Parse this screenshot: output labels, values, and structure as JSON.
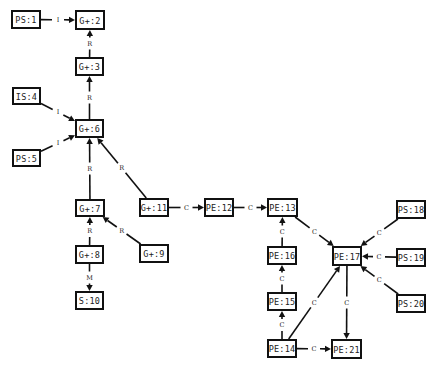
{
  "diagram": {
    "width": 433,
    "height": 369,
    "colors": {
      "stroke": "#111111",
      "text": "#222222",
      "background": "#ffffff"
    },
    "nodes": [
      {
        "id": "PS:1",
        "label": "PS:1",
        "x": 12,
        "y": 11,
        "w": 28,
        "h": 17
      },
      {
        "id": "G+:2",
        "label": "G+:2",
        "x": 76,
        "y": 11,
        "w": 28,
        "h": 18
      },
      {
        "id": "G+:3",
        "label": "G+:3",
        "x": 76,
        "y": 58,
        "w": 27,
        "h": 17
      },
      {
        "id": "IS:4",
        "label": "IS:4",
        "x": 13,
        "y": 88,
        "w": 27,
        "h": 16
      },
      {
        "id": "PS:5",
        "label": "PS:5",
        "x": 13,
        "y": 150,
        "w": 27,
        "h": 16
      },
      {
        "id": "G+:6",
        "label": "G+:6",
        "x": 76,
        "y": 120,
        "w": 27,
        "h": 17
      },
      {
        "id": "G+:7",
        "label": "G+:7",
        "x": 76,
        "y": 200,
        "w": 28,
        "h": 16
      },
      {
        "id": "G+:8",
        "label": "G+:8",
        "x": 76,
        "y": 246,
        "w": 27,
        "h": 17
      },
      {
        "id": "G+:9",
        "label": "G+:9",
        "x": 140,
        "y": 245,
        "w": 28,
        "h": 17
      },
      {
        "id": "S:10",
        "label": "S:10",
        "x": 76,
        "y": 292,
        "w": 27,
        "h": 17
      },
      {
        "id": "G+:11",
        "label": "G+:11",
        "x": 140,
        "y": 199,
        "w": 28,
        "h": 17
      },
      {
        "id": "PE:12",
        "label": "PE:12",
        "x": 205,
        "y": 199,
        "w": 28,
        "h": 17
      },
      {
        "id": "PE:13",
        "label": "PE:13",
        "x": 268,
        "y": 199,
        "w": 29,
        "h": 17
      },
      {
        "id": "PE:14",
        "label": "PE:14",
        "x": 268,
        "y": 340,
        "w": 28,
        "h": 17
      },
      {
        "id": "PE:15",
        "label": "PE:15",
        "x": 268,
        "y": 293,
        "w": 28,
        "h": 17
      },
      {
        "id": "PE:16",
        "label": "PE:16",
        "x": 268,
        "y": 247,
        "w": 28,
        "h": 17
      },
      {
        "id": "PE:17",
        "label": "PE:17",
        "x": 333,
        "y": 247,
        "w": 28,
        "h": 18
      },
      {
        "id": "PS:18",
        "label": "PS:18",
        "x": 397,
        "y": 201,
        "w": 28,
        "h": 17
      },
      {
        "id": "PS:19",
        "label": "PS:19",
        "x": 397,
        "y": 249,
        "w": 28,
        "h": 17
      },
      {
        "id": "PS:20",
        "label": "PS:20",
        "x": 397,
        "y": 295,
        "w": 28,
        "h": 17
      },
      {
        "id": "PE:21",
        "label": "PE:21",
        "x": 332,
        "y": 340,
        "w": 29,
        "h": 18
      }
    ],
    "edges": [
      {
        "from": "PS:1",
        "to": "G+:2",
        "label": "I"
      },
      {
        "from": "G+:3",
        "to": "G+:2",
        "label": "R"
      },
      {
        "from": "G+:6",
        "to": "G+:3",
        "label": "R"
      },
      {
        "from": "IS:4",
        "to": "G+:6",
        "label": "I"
      },
      {
        "from": "PS:5",
        "to": "G+:6",
        "label": "I"
      },
      {
        "from": "G+:7",
        "to": "G+:6",
        "label": "R"
      },
      {
        "from": "G+:11",
        "to": "G+:6",
        "label": "R"
      },
      {
        "from": "G+:8",
        "to": "G+:7",
        "label": "R"
      },
      {
        "from": "G+:9",
        "to": "G+:7",
        "label": "R"
      },
      {
        "from": "G+:8",
        "to": "S:10",
        "label": "M"
      },
      {
        "from": "G+:11",
        "to": "PE:12",
        "label": "C"
      },
      {
        "from": "PE:12",
        "to": "PE:13",
        "label": "C"
      },
      {
        "from": "PE:16",
        "to": "PE:13",
        "label": "C"
      },
      {
        "from": "PE:15",
        "to": "PE:16",
        "label": "C"
      },
      {
        "from": "PE:14",
        "to": "PE:15",
        "label": "C"
      },
      {
        "from": "PE:13",
        "to": "PE:17",
        "label": "C"
      },
      {
        "from": "PS:18",
        "to": "PE:17",
        "label": "C"
      },
      {
        "from": "PS:19",
        "to": "PE:17",
        "label": "C"
      },
      {
        "from": "PS:20",
        "to": "PE:17",
        "label": "C"
      },
      {
        "from": "PE:14",
        "to": "PE:17",
        "label": "C"
      },
      {
        "from": "PE:17",
        "to": "PE:21",
        "label": "C"
      },
      {
        "from": "PE:14",
        "to": "PE:21",
        "label": "C"
      }
    ]
  }
}
